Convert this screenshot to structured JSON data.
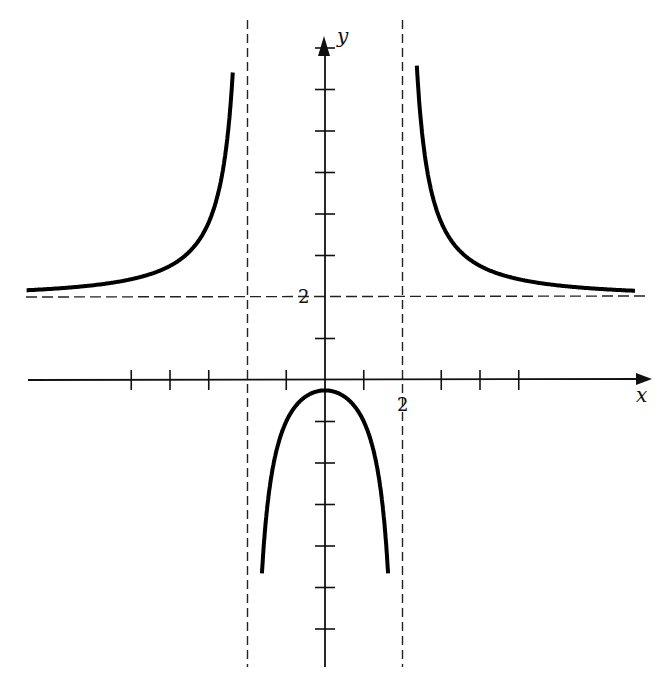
{
  "chart_data": {
    "type": "line",
    "title": "",
    "xlabel": "x",
    "ylabel": "y",
    "function": "y = (2x^2 + 1) / (x^2 - 4)",
    "vertical_asymptotes": [
      -2,
      2
    ],
    "horizontal_asymptote": 2,
    "labeled_ticks": {
      "x": [
        {
          "value": 2,
          "label": "2"
        }
      ],
      "y": [
        {
          "value": 2,
          "label": "2"
        }
      ]
    },
    "x_ticks": [
      -5,
      -4,
      -3,
      -2,
      -1,
      0,
      1,
      2,
      3,
      4,
      5
    ],
    "y_ticks": [
      -6,
      -5,
      -4,
      -3,
      -2,
      -1,
      1,
      2,
      3,
      4,
      5,
      6,
      7,
      8
    ],
    "xlim": [
      -8.4,
      8.2
    ],
    "ylim": [
      -7.5,
      8.3
    ],
    "grid": false,
    "legend": null,
    "series": [
      {
        "name": "left branch",
        "x_range": [
          -7.8,
          -2.07
        ],
        "shape": "increasing to +infinity as x -> -2-"
      },
      {
        "name": "middle branch",
        "x_range": [
          -1.8,
          1.8
        ],
        "shape": "downward cap, max at (0, -0.25)"
      },
      {
        "name": "right branch",
        "x_range": [
          2.07,
          8.0
        ],
        "shape": "decreasing from +infinity toward y=2"
      }
    ],
    "sample_points": [
      {
        "x": 0,
        "y": -0.25
      },
      {
        "x": 1,
        "y": -1.0
      },
      {
        "x": -1,
        "y": -1.0
      },
      {
        "x": 3,
        "y": 3.8
      },
      {
        "x": -3,
        "y": 3.8
      },
      {
        "x": 4,
        "y": 2.75
      },
      {
        "x": 6,
        "y": 2.28
      }
    ]
  },
  "axes": {
    "x_label": "x",
    "y_label": "y",
    "x_tick_label_2": "2",
    "y_tick_label_2": "2"
  }
}
